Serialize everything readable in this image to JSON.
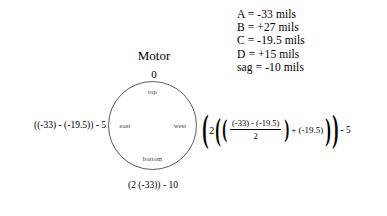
{
  "diagram": {
    "title": "Motor",
    "reference_label": "0",
    "directions": {
      "top": "top",
      "bottom": "bottom",
      "east": "east",
      "west": "west"
    },
    "formulas": {
      "east": "((-33) - (-19.5)) - 5",
      "bottom": "(2 (-33)) - 10"
    },
    "colors": {
      "circle_stroke": "#5a5a5a",
      "text": "#000000",
      "direction_label": "#3a3a3a"
    }
  },
  "legend": {
    "lines": [
      "A = -33 mils",
      "B = +27 mils",
      "C = -19.5 mils",
      "D = +15 mils",
      "sag = -10 mils"
    ]
  },
  "equation": {
    "open_paren_outer": "(",
    "coefficient": "2",
    "open_paren_mid": "(",
    "open_paren_inner": "(",
    "fraction": {
      "numerator": "(-33) - (-19.5)",
      "denominator": "2"
    },
    "close_paren_inner": ")",
    "plus_term": "+ (-19.5)",
    "close_paren_mid": ")",
    "close_paren_outer": ")",
    "tail": "- 5"
  }
}
